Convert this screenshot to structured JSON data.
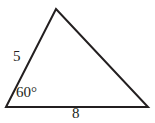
{
  "figure": {
    "kind": "triangle-diagram",
    "background_color": "#ffffff",
    "stroke_color": "#231f20",
    "stroke_width": 2,
    "text_color": "#231f20",
    "vertices": {
      "bottom_left": {
        "x": 6,
        "y": 107
      },
      "apex": {
        "x": 56,
        "y": 9
      },
      "bottom_right": {
        "x": 148,
        "y": 107
      }
    },
    "labels": {
      "left_side": "5",
      "base_side": "8",
      "bottom_left_angle": "60°"
    }
  },
  "chart_data": {
    "type": "diagram",
    "title": "",
    "shape": "triangle",
    "annotations": [
      {
        "name": "left-side-length",
        "text": "5",
        "target": "side from bottom-left vertex to apex"
      },
      {
        "name": "bottom-left-angle",
        "text": "60°",
        "target": "interior angle at bottom-left vertex"
      },
      {
        "name": "base-length",
        "text": "8",
        "target": "base side from bottom-left vertex to bottom-right vertex"
      }
    ]
  }
}
